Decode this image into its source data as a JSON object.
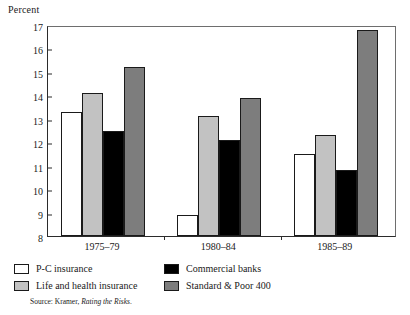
{
  "chart_data": {
    "type": "bar",
    "title": "",
    "xlabel": "",
    "ylabel": "Percent",
    "categories": [
      "1975–79",
      "1980–84",
      "1985–89"
    ],
    "series": [
      {
        "name": "P-C insurance",
        "color": "#ffffff",
        "values": [
          13.3,
          8.9,
          11.5
        ]
      },
      {
        "name": "Life and health insurance",
        "color": "#c2c2c2",
        "values": [
          14.1,
          13.1,
          12.3
        ]
      },
      {
        "name": "Commercial banks",
        "color": "#000000",
        "values": [
          12.5,
          12.1,
          10.8
        ]
      },
      {
        "name": "Standard & Poor 400",
        "color": "#7d7d7d",
        "values": [
          15.2,
          13.9,
          16.8
        ]
      }
    ],
    "ylim": [
      8,
      17
    ],
    "yticks": [
      8,
      9,
      10,
      11,
      12,
      13,
      14,
      15,
      16,
      17
    ],
    "ytick_labels": [
      "8",
      "9",
      "10",
      "11",
      "12",
      "13",
      "14",
      "15",
      "16",
      "17"
    ],
    "grid": false,
    "legend_position": "below"
  },
  "source": {
    "prefix": "Source: Kramer, ",
    "title": "Rating the Risks",
    "suffix": "."
  }
}
